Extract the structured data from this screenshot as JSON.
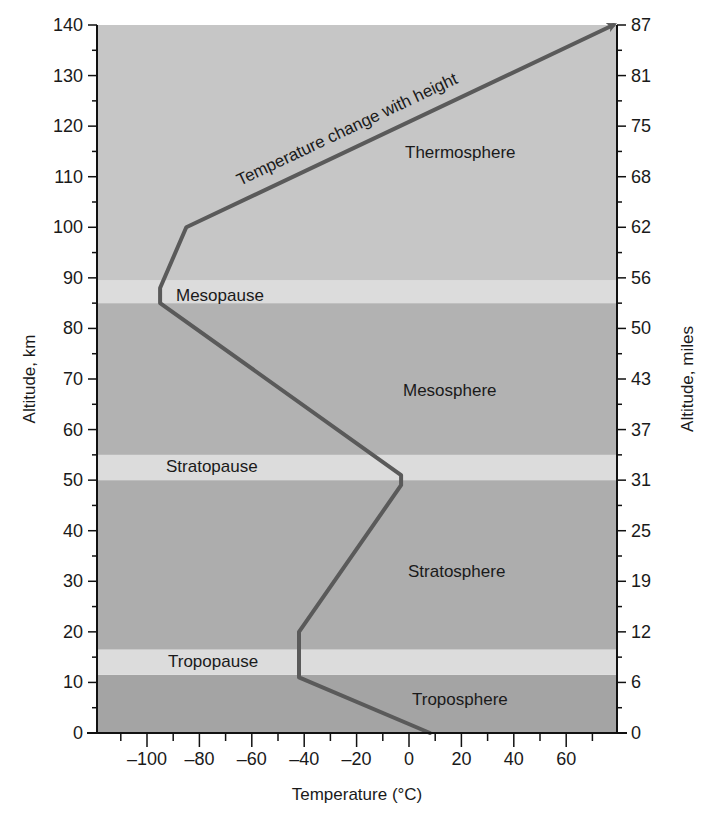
{
  "chart_data": {
    "type": "line",
    "title": "",
    "xlabel": "Temperature (°C)",
    "ylabel": "Altitude, km",
    "ylabel_right": "Altitude, miles",
    "xlim": [
      -120,
      78
    ],
    "ylim": [
      0,
      140
    ],
    "grid": false,
    "x_ticks": [
      -100,
      -80,
      -60,
      -40,
      -20,
      0,
      20,
      40,
      60
    ],
    "x_tick_labels": [
      "–100",
      "–80",
      "–60",
      "–40",
      "–20",
      "0",
      "20",
      "40",
      "60"
    ],
    "y_ticks_km": [
      0,
      10,
      20,
      30,
      40,
      50,
      60,
      70,
      80,
      90,
      100,
      110,
      120,
      130,
      140
    ],
    "y_ticks_miles_labels": [
      "0",
      "6",
      "12",
      "19",
      "25",
      "31",
      "37",
      "43",
      "50",
      "56",
      "62",
      "68",
      "75",
      "81",
      "87"
    ],
    "series": [
      {
        "name": "Temperature change with height",
        "points": [
          {
            "temp_c": 8,
            "alt_km": 0
          },
          {
            "temp_c": -42,
            "alt_km": 11
          },
          {
            "temp_c": -42,
            "alt_km": 20
          },
          {
            "temp_c": -3,
            "alt_km": 49
          },
          {
            "temp_c": -3,
            "alt_km": 51
          },
          {
            "temp_c": -95,
            "alt_km": 85
          },
          {
            "temp_c": -95,
            "alt_km": 88
          },
          {
            "temp_c": -85,
            "alt_km": 100
          },
          {
            "temp_c": 78,
            "alt_km": 140
          }
        ],
        "arrow_at_end": true
      }
    ],
    "layers": [
      {
        "name": "Troposphere",
        "from_km": 0,
        "to_km": 11.5,
        "kind": "layer"
      },
      {
        "name": "Tropopause",
        "from_km": 11.5,
        "to_km": 16.5,
        "kind": "pause"
      },
      {
        "name": "Stratosphere",
        "from_km": 16.5,
        "to_km": 50,
        "kind": "layer"
      },
      {
        "name": "Stratopause",
        "from_km": 50,
        "to_km": 55,
        "kind": "pause"
      },
      {
        "name": "Mesosphere",
        "from_km": 55,
        "to_km": 85,
        "kind": "layer"
      },
      {
        "name": "Mesopause",
        "from_km": 85,
        "to_km": 89.5,
        "kind": "pause"
      },
      {
        "name": "Thermosphere",
        "from_km": 89.5,
        "to_km": 140,
        "kind": "layer"
      }
    ],
    "annotations": [
      "Temperature change with height"
    ]
  },
  "colors": {
    "thermosphere": "#c6c6c6",
    "mesosphere": "#b2b2b2",
    "stratosphere": "#adadad",
    "troposphere": "#a4a4a4",
    "pause": "#dcdcdc",
    "curve": "#5a5a5a",
    "axis": "#111111"
  },
  "labels": {
    "thermosphere": "Thermosphere",
    "mesopause": "Mesopause",
    "mesosphere": "Mesosphere",
    "stratopause": "Stratopause",
    "stratosphere": "Stratosphere",
    "tropopause": "Tropopause",
    "troposphere": "Troposphere",
    "curve": "Temperature change with height",
    "x_axis_title": "Temperature (°C)",
    "y_axis_left_title": "Altitude, km",
    "y_axis_right_title": "Altitude, miles"
  }
}
